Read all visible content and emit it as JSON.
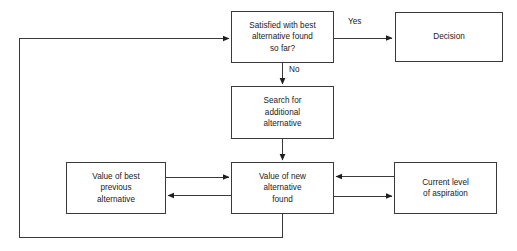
{
  "diagram": {
    "background_color": "#ffffff",
    "line_color": "#3a3a3a",
    "text_color": "#1a1a1a",
    "nodes": [
      {
        "id": "satisfied",
        "label": "Satisfied with best\nalternative found\nso far?"
      },
      {
        "id": "decision",
        "label": "Decision"
      },
      {
        "id": "search",
        "label": "Search for\nadditional\nalternative"
      },
      {
        "id": "newvalue",
        "label": "Value of new\nalternative\nfound"
      },
      {
        "id": "bestprev",
        "label": "Value of best\nprevious\nalternative"
      },
      {
        "id": "aspiration",
        "label": "Current level\nof aspiration"
      }
    ],
    "edge_labels": {
      "yes": "Yes",
      "no": "No"
    },
    "edges": [
      {
        "from": "satisfied",
        "to": "decision",
        "label": "Yes",
        "direction": "right"
      },
      {
        "from": "satisfied",
        "to": "search",
        "label": "No",
        "direction": "down"
      },
      {
        "from": "search",
        "to": "newvalue",
        "label": "",
        "direction": "down"
      },
      {
        "from": "bestprev",
        "to": "newvalue",
        "label": "",
        "direction": "right"
      },
      {
        "from": "newvalue",
        "to": "bestprev",
        "label": "",
        "direction": "left"
      },
      {
        "from": "aspiration",
        "to": "newvalue",
        "label": "",
        "direction": "left"
      },
      {
        "from": "newvalue",
        "to": "aspiration",
        "label": "",
        "direction": "right"
      },
      {
        "from": "newvalue",
        "to": "satisfied",
        "label": "",
        "direction": "feedback-loop"
      }
    ]
  }
}
